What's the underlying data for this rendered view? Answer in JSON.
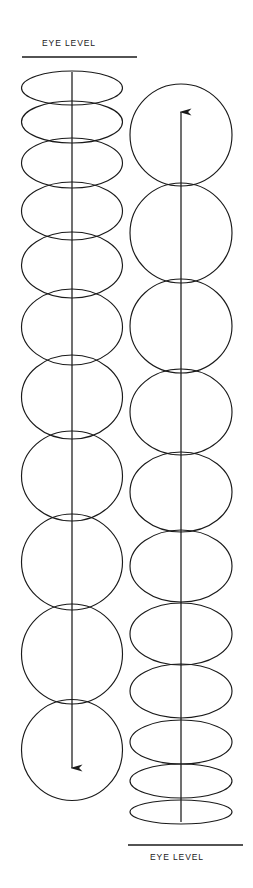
{
  "figure": {
    "title_top": "EYE LEVEL",
    "title_bottom": "EYE LEVEL",
    "stroke_color": "#1a1a1a",
    "background_color": "#ffffff",
    "canvas": {
      "width": 253,
      "height": 888
    },
    "top_rule": {
      "x1": 22,
      "x2": 137,
      "y": 57,
      "thickness": 1.6
    },
    "bottom_rule": {
      "x1": 128,
      "x2": 243,
      "y": 845,
      "thickness": 1.6
    },
    "columns": [
      {
        "name": "left-column",
        "axis": {
          "x": 72,
          "y_top": 72,
          "y_bottom": 768,
          "arrow": "down"
        },
        "ellipse_rx": 50.5,
        "ellipses": [
          {
            "cy": 88,
            "ry": 17
          },
          {
            "cy": 122,
            "ry": 21
          },
          {
            "cy": 163,
            "ry": 25
          },
          {
            "cy": 211,
            "ry": 29
          },
          {
            "cy": 265,
            "ry": 33
          },
          {
            "cy": 327,
            "ry": 38
          },
          {
            "cy": 397,
            "ry": 42
          },
          {
            "cy": 476,
            "ry": 45
          },
          {
            "cy": 562,
            "ry": 48
          },
          {
            "cy": 654,
            "ry": 50
          },
          {
            "cy": 750,
            "ry": 50.5
          }
        ]
      },
      {
        "name": "right-column",
        "axis": {
          "x": 181,
          "y_top": 112,
          "y_bottom": 822,
          "arrow": "up"
        },
        "ellipse_rx": 51,
        "ellipses": [
          {
            "cy": 135,
            "ry": 51
          },
          {
            "cy": 233,
            "ry": 50
          },
          {
            "cy": 326,
            "ry": 47
          },
          {
            "cy": 412,
            "ry": 43
          },
          {
            "cy": 492,
            "ry": 40
          },
          {
            "cy": 566,
            "ry": 36
          },
          {
            "cy": 634,
            "ry": 31
          },
          {
            "cy": 691,
            "ry": 27
          },
          {
            "cy": 742,
            "ry": 22
          },
          {
            "cy": 781,
            "ry": 17
          },
          {
            "cy": 812,
            "ry": 12
          }
        ]
      }
    ]
  }
}
